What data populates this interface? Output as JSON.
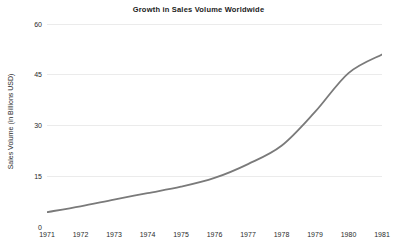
{
  "chart_data": {
    "type": "line",
    "title": "Growth in Sales Volume Worldwide",
    "xlabel": "",
    "ylabel": "Sales Volume (in Billions USD)",
    "categories": [
      "1971",
      "1972",
      "1973",
      "1974",
      "1975",
      "1976",
      "1977",
      "1978",
      "1979",
      "1980",
      "1981"
    ],
    "x": [
      1971,
      1972,
      1973,
      1974,
      1975,
      1976,
      1977,
      1978,
      1979,
      1980,
      1981
    ],
    "values": [
      4.4,
      6.1,
      8.1,
      10.0,
      11.9,
      14.5,
      18.6,
      24.0,
      34.0,
      45.5,
      51.0
    ],
    "series": [
      {
        "name": "Sales Volume",
        "values": [
          4.4,
          6.1,
          8.1,
          10.0,
          11.9,
          14.5,
          18.6,
          24.0,
          34.0,
          45.5,
          51.0
        ]
      }
    ],
    "ylim": [
      0,
      60
    ],
    "yticks": [
      0,
      15,
      30,
      45,
      60
    ],
    "ytick_labels": [
      "0",
      "15",
      "30",
      "45",
      "60"
    ],
    "xtick_labels": [
      "1971",
      "1972",
      "1973",
      "1974",
      "1975",
      "1976",
      "1977",
      "1978",
      "1979",
      "1980",
      "1981"
    ],
    "grid": "horizontal",
    "legend": "none",
    "smoothing": "spline",
    "line_color": "#7a7a7a",
    "line_width": 1.8,
    "grid_color": "#ebebeb",
    "axis_color": "#4a4a4a",
    "background": "#ffffff"
  }
}
